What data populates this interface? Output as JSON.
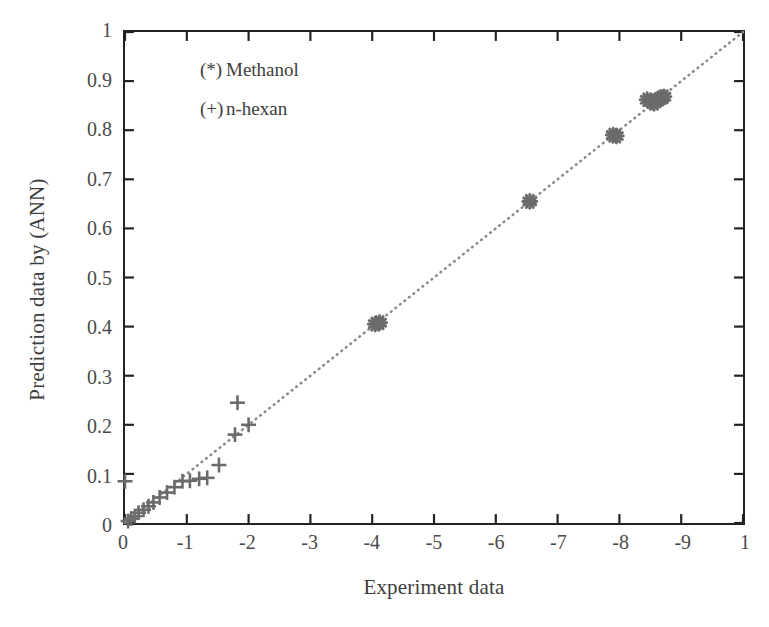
{
  "figure": {
    "kind": "scatter-parity-plot"
  },
  "axes": {
    "xlabel": "Experiment data",
    "ylabel": "Prediction data by (ANN)",
    "xticks": [
      "0",
      "-1",
      "-2",
      "-3",
      "-4",
      "-5",
      "-6",
      "-7",
      "-8",
      "-9",
      "1"
    ],
    "yticks": [
      "0",
      "0.1",
      "0.2",
      "0.3",
      "0.4",
      "0.5",
      "0.6",
      "0.7",
      "0.8",
      "0.9",
      "1"
    ]
  },
  "legend": {
    "entries": [
      {
        "symbol": "(*)",
        "label": "Methanol"
      },
      {
        "symbol": "(+)",
        "label": "n-hexan"
      }
    ]
  },
  "colors": {
    "frame": "#222222",
    "marker": "#6b6b6b",
    "reference_line": "#8a8a8a",
    "text": "#3d3d3d",
    "background": "#ffffff"
  },
  "chart_data": {
    "type": "scatter",
    "title": "",
    "xlabel": "Experiment data",
    "ylabel": "Prediction data by (ANN)",
    "xlim": [
      0,
      1
    ],
    "ylim": [
      0,
      1
    ],
    "xtick_values": [
      0,
      0.1,
      0.2,
      0.3,
      0.4,
      0.5,
      0.6,
      0.7,
      0.8,
      0.9,
      1
    ],
    "ytick_values": [
      0,
      0.1,
      0.2,
      0.3,
      0.4,
      0.5,
      0.6,
      0.7,
      0.8,
      0.9,
      1
    ],
    "xtick_labels": [
      "0",
      "-1",
      "-2",
      "-3",
      "-4",
      "-5",
      "-6",
      "-7",
      "-8",
      "-9",
      "1"
    ],
    "ytick_labels": [
      "0",
      "0.1",
      "0.2",
      "0.3",
      "0.4",
      "0.5",
      "0.6",
      "0.7",
      "0.8",
      "0.9",
      "1"
    ],
    "grid": false,
    "legend_position": "upper-left-inside",
    "annotations": [
      {
        "text": "(*) Methanol",
        "x": 0.12,
        "y": 0.9
      },
      {
        "text": "(+) n-hexan",
        "x": 0.12,
        "y": 0.8
      }
    ],
    "reference_line": {
      "name": "y = x parity line",
      "style": "dotted",
      "x": [
        0,
        1
      ],
      "y": [
        0,
        1
      ]
    },
    "series": [
      {
        "name": "n-hexan",
        "marker": "+",
        "points": [
          [
            0.0,
            0.085
          ],
          [
            0.005,
            0.004
          ],
          [
            0.01,
            0.009
          ],
          [
            0.016,
            0.014
          ],
          [
            0.022,
            0.021
          ],
          [
            0.03,
            0.027
          ],
          [
            0.038,
            0.034
          ],
          [
            0.046,
            0.042
          ],
          [
            0.056,
            0.052
          ],
          [
            0.068,
            0.062
          ],
          [
            0.08,
            0.073
          ],
          [
            0.093,
            0.085
          ],
          [
            0.105,
            0.086
          ],
          [
            0.12,
            0.09
          ],
          [
            0.133,
            0.092
          ],
          [
            0.152,
            0.118
          ],
          [
            0.178,
            0.18
          ],
          [
            0.182,
            0.245
          ],
          [
            0.2,
            0.2
          ]
        ]
      },
      {
        "name": "Methanol",
        "marker": "*",
        "points": [
          [
            0.405,
            0.405
          ],
          [
            0.412,
            0.408
          ],
          [
            0.655,
            0.655
          ],
          [
            0.79,
            0.79
          ],
          [
            0.795,
            0.788
          ],
          [
            0.845,
            0.862
          ],
          [
            0.852,
            0.858
          ],
          [
            0.856,
            0.855
          ],
          [
            0.86,
            0.86
          ],
          [
            0.864,
            0.863
          ],
          [
            0.868,
            0.866
          ],
          [
            0.872,
            0.868
          ]
        ]
      }
    ]
  }
}
